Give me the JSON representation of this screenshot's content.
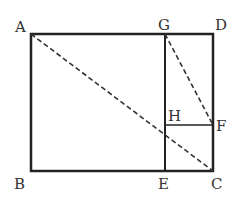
{
  "diagram": {
    "type": "geometry",
    "points": {
      "A": {
        "label": "A",
        "x": 31,
        "y": 34
      },
      "B": {
        "label": "B",
        "x": 31,
        "y": 171
      },
      "C": {
        "label": "C",
        "x": 213,
        "y": 171
      },
      "D": {
        "label": "D",
        "x": 213,
        "y": 34
      },
      "G": {
        "label": "G",
        "x": 165,
        "y": 34
      },
      "E": {
        "label": "E",
        "x": 165,
        "y": 171
      },
      "H": {
        "label": "H",
        "x": 165,
        "y": 125
      },
      "F": {
        "label": "F",
        "x": 213,
        "y": 125
      }
    },
    "solid_segments": [
      "AD",
      "DC",
      "CB",
      "BA",
      "GE",
      "HF"
    ],
    "dashed_segments": [
      "AC",
      "GF"
    ],
    "colors": {
      "stroke": "#222222",
      "label": "#333333"
    }
  }
}
